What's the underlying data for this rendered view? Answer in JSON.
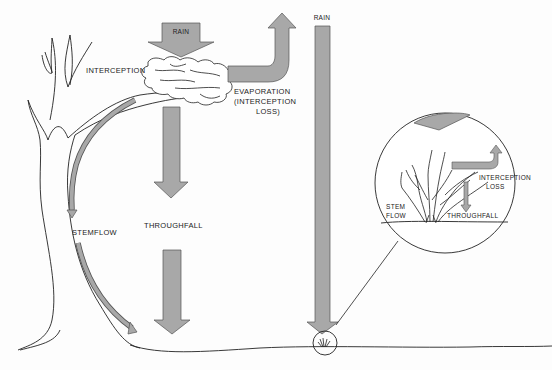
{
  "diagram": {
    "type": "hydrology-interception-process",
    "colors": {
      "arrow_fill": "#a8a8a8",
      "arrow_stroke": "#555555",
      "line": "#222222",
      "background": "#fdfdfd"
    },
    "labels": {
      "rain_box": "RAIN",
      "interception": "INTERCEPTION",
      "evaporation_line1": "EVAPORATION",
      "evaporation_line2": "(INTERCEPTION",
      "evaporation_line3": "LOSS)",
      "throughfall": "THROUGHFALL",
      "stemflow": "STEMFLOW",
      "rain_column": "RAIN"
    },
    "inset": {
      "interception_line1": "INTERCEPTION",
      "interception_line2": "LOSS",
      "stem_line1": "STEM",
      "stem_line2": "FLOW",
      "throughfall": "THROUGHFALL"
    }
  }
}
